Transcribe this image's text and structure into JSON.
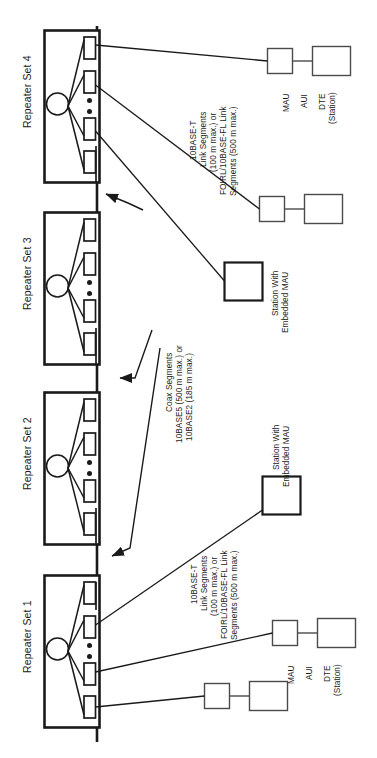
{
  "diagram": {
    "colors": {
      "stroke": "#1a1a1a",
      "thin_stroke": "#3a3a3a",
      "background": "#ffffff",
      "fill": "#ffffff"
    },
    "repeater_sets": [
      {
        "id": "repeater-set-4",
        "label": "Repeater Set 4"
      },
      {
        "id": "repeater-set-3",
        "label": "Repeater Set 3"
      },
      {
        "id": "repeater-set-2",
        "label": "Repeater Set 2"
      },
      {
        "id": "repeater-set-1",
        "label": "Repeater Set 1"
      }
    ],
    "link_segment_note": {
      "line1": "10BASE-T",
      "line2": "Link Segments",
      "line3": "(100 m max.) or",
      "line4": "FOIRL/10BASE-FL Link",
      "line5": "Segments (500 m max.)"
    },
    "coax_note": {
      "line1": "Coax Segments",
      "line2": "10BASE5 (500 m max.) or",
      "line3": "10BASE2 (185 m max.)"
    },
    "station_note": {
      "line1": "Station With",
      "line2": "Embedded MAU"
    },
    "dte_group": {
      "mau": "MAU",
      "aui": "AUI",
      "dte_line1": "DTE",
      "dte_line2": "(Station)"
    }
  }
}
